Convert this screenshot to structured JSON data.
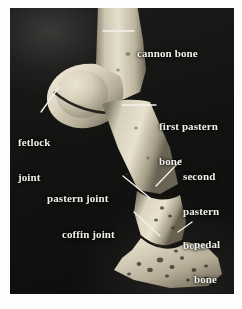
{
  "figure": {
    "background_color": "#fdfdfb",
    "plate_color": "#141414",
    "label_color": "#f2f0ea",
    "bone_color": "#cfc6b2"
  },
  "labels": [
    {
      "id": "cannon-bone",
      "text": "cannon bone",
      "lines": [
        "cannon bone"
      ],
      "side": "right"
    },
    {
      "id": "fetlock-joint",
      "text": "fetlock joint",
      "lines": [
        "fetlock",
        "joint"
      ],
      "side": "left"
    },
    {
      "id": "first-pastern-bone",
      "text": "first pastern bone",
      "lines": [
        "first pastern",
        "bone"
      ],
      "side": "right"
    },
    {
      "id": "second-pastern-bone",
      "text": "second pastern bone",
      "lines": [
        "second",
        "pastern",
        "bone"
      ],
      "side": "right"
    },
    {
      "id": "pastern-joint",
      "text": "pastern joint",
      "lines": [
        "pastern joint"
      ],
      "side": "left"
    },
    {
      "id": "coffin-joint",
      "text": "coffin joint",
      "lines": [
        "coffin joint"
      ],
      "side": "left"
    },
    {
      "id": "pedal-bone",
      "text": "pedal bone",
      "lines": [
        "pedal",
        "bone"
      ],
      "side": "right"
    }
  ],
  "label_text": {
    "cannon_bone": "cannon bone",
    "fetlock_joint_l1": "fetlock",
    "fetlock_joint_l2": "joint",
    "first_pastern_l1": "first pastern",
    "first_pastern_l2": "bone",
    "second_pastern_l1": "second",
    "second_pastern_l2": "pastern",
    "second_pastern_l3": "bone",
    "pastern_joint": "pastern joint",
    "coffin_joint": "coffin joint",
    "pedal_bone_l1": "pedal",
    "pedal_bone_l2": "bone"
  },
  "caption": {
    "text": "   "
  }
}
